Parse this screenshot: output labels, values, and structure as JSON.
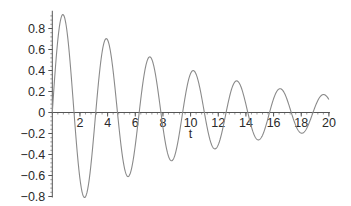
{
  "chart_data": {
    "type": "line",
    "title": "",
    "xlabel": "t",
    "ylabel": "",
    "xlim": [
      0,
      20
    ],
    "ylim": [
      -0.8,
      0.95
    ],
    "grid": false,
    "legend": null,
    "x_ticks": [
      2,
      4,
      6,
      8,
      10,
      12,
      14,
      16,
      18,
      20
    ],
    "x_tick_labels": [
      "2",
      "4",
      "6",
      "8",
      "10",
      "12",
      "14",
      "16",
      "18",
      "20"
    ],
    "y_ticks": [
      -0.8,
      -0.6,
      -0.4,
      -0.2,
      0,
      0.2,
      0.4,
      0.6,
      0.8
    ],
    "y_tick_labels": [
      "-0.8",
      "-0.6",
      "-0.4",
      "-0.2",
      "0",
      "0.2",
      "0.4",
      "0.6",
      "0.8"
    ],
    "series": [
      {
        "name": "damped oscillation",
        "description": "approx. e^(-0.09 t) * sin(2 t)",
        "color": "#8a8a8a",
        "decay": 0.09,
        "omega": 2,
        "key_points": {
          "t": [
            0,
            0.79,
            1.57,
            2.36,
            3.14,
            3.93,
            5.5,
            7.07,
            8.64,
            10.21,
            11.78,
            13.35,
            14.92,
            16.49,
            18.06,
            19.63,
            20
          ],
          "y": [
            0,
            0.93,
            0,
            -0.81,
            0,
            0.7,
            -0.61,
            0.53,
            -0.46,
            0.4,
            -0.35,
            0.3,
            -0.26,
            0.23,
            -0.2,
            0.17,
            0.12
          ]
        }
      }
    ]
  },
  "axes": {
    "axis_color": "#555555",
    "origin_px": [
      52.3,
      112.5
    ],
    "px_per_t": 13.83,
    "px_per_y": 105
  }
}
